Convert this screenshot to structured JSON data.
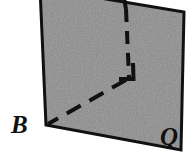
{
  "figure": {
    "type": "geometry-diagram",
    "width": 193,
    "height": 158,
    "background_color": "#ffffff",
    "plane": {
      "name": "Q",
      "label": "Q",
      "fill_color": "#8a8a8a",
      "fill_texture": "mottled-halftone-gray",
      "stroke_color": "#111111",
      "stroke_width": 3,
      "corners": [
        {
          "name": "top-left",
          "x": 40,
          "y": -12
        },
        {
          "name": "top-right",
          "x": 184,
          "y": 12
        },
        {
          "name": "bottom-right",
          "x": 181,
          "y": 150
        },
        {
          "name": "bottom-left",
          "x": 46,
          "y": 125
        }
      ]
    },
    "vertical_line": {
      "name": "perpendicular-line",
      "stroke_color": "#111111",
      "stroke_width": 4,
      "visible_segment": {
        "x1": 124,
        "y1": 0,
        "x2": 126,
        "y2": 8,
        "style": "solid"
      },
      "hidden_segment": {
        "x1": 126,
        "y1": 8,
        "x2": 129,
        "y2": 78,
        "style": "dashed"
      }
    },
    "diagonal_line": {
      "name": "segment-to-B",
      "stroke_color": "#111111",
      "stroke_width": 4,
      "style": "dashed",
      "x1": 127,
      "y1": 79,
      "x2": 48,
      "y2": 124
    },
    "right_angle_marker": {
      "name": "right-angle-mark",
      "stroke_color": "#111111",
      "stroke_width": 4,
      "points": "133,63 133,78 120,78"
    },
    "labels": [
      {
        "id": "B",
        "text": "B",
        "x": 11,
        "y": 112,
        "font_size": 25,
        "style": "italic-serif-bold",
        "position": "outside-bottom-left"
      },
      {
        "id": "Q",
        "text": "Q",
        "x": 160,
        "y": 124,
        "font_size": 25,
        "style": "italic-serif-bold",
        "position": "inside-bottom-right"
      }
    ]
  }
}
